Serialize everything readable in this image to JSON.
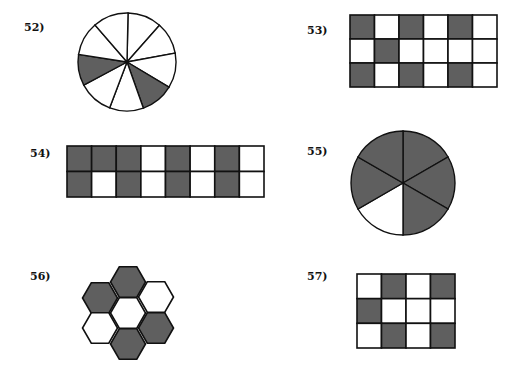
{
  "colors": {
    "shaded": "#5f5f5f",
    "unshaded": "#ffffff",
    "stroke": "#111111"
  },
  "problems": [
    {
      "id": "52",
      "label": "52)",
      "type": "circle",
      "slices": 9,
      "shaded_count": 2,
      "total": 9
    },
    {
      "id": "53",
      "label": "53)",
      "type": "grid",
      "rows": 3,
      "cols": 6,
      "cells": [
        [
          1,
          0,
          1,
          0,
          1,
          0
        ],
        [
          0,
          1,
          0,
          0,
          0,
          0
        ],
        [
          1,
          0,
          1,
          0,
          1,
          0
        ]
      ],
      "shaded_count": 7,
      "total": 18
    },
    {
      "id": "54",
      "label": "54)",
      "type": "grid",
      "rows": 2,
      "cols": 8,
      "cells": [
        [
          1,
          1,
          1,
          0,
          1,
          0,
          1,
          0
        ],
        [
          1,
          0,
          1,
          0,
          1,
          0,
          1,
          0
        ]
      ],
      "shaded_count": 9,
      "total": 16
    },
    {
      "id": "55",
      "label": "55)",
      "type": "circle",
      "slices": 6,
      "shaded_count": 5,
      "total": 6
    },
    {
      "id": "56",
      "label": "56)",
      "type": "hexagons",
      "hexes": 7,
      "shaded_count": 4,
      "total": 7
    },
    {
      "id": "57",
      "label": "57)",
      "type": "grid",
      "rows": 3,
      "cols": 4,
      "cells": [
        [
          0,
          1,
          0,
          1
        ],
        [
          1,
          0,
          0,
          0
        ],
        [
          0,
          1,
          0,
          1
        ]
      ],
      "shaded_count": 5,
      "total": 12
    }
  ]
}
